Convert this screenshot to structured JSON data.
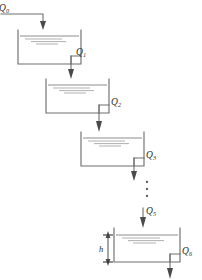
{
  "figure": {
    "background_color": "#ffffff",
    "line_color": "#6f6f6f",
    "water_color": "#8e8e8e",
    "label_color": "#2b2b2b"
  },
  "inflow": {
    "symbol": "Q",
    "subscript": "0",
    "label": "Q0",
    "icon": "down-arrow-icon"
  },
  "ellipsis": {
    "glyph": "vertical-ellipsis",
    "dot_count": 3
  },
  "intermediate_flow": {
    "symbol": "Q",
    "subscript": "5",
    "label": "Q5",
    "icon": "down-arrow-icon"
  },
  "dimension": {
    "symbol": "h",
    "label": "h",
    "icon": "double-arrow-vertical-icon"
  },
  "tanks": [
    {
      "index": 1,
      "outflow_symbol": "Q",
      "outflow_subscript": "1",
      "outflow_label": "Q1",
      "x": 18,
      "y": 30,
      "width": 63,
      "height": 34
    },
    {
      "index": 2,
      "outflow_symbol": "Q",
      "outflow_subscript": "2",
      "outflow_label": "Q2",
      "x": 46,
      "y": 79,
      "width": 63,
      "height": 34
    },
    {
      "index": 3,
      "outflow_symbol": "Q",
      "outflow_subscript": "3",
      "outflow_label": "Q3",
      "x": 81,
      "y": 132,
      "width": 63,
      "height": 34
    },
    {
      "index": 4,
      "outflow_symbol": "Q",
      "outflow_subscript": "6",
      "outflow_label": "Q6",
      "x": 114,
      "y": 228,
      "width": 66,
      "height": 34
    }
  ]
}
